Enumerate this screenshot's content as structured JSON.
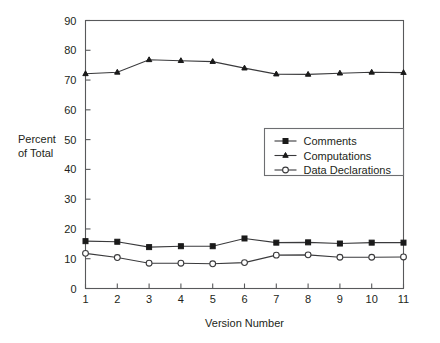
{
  "chart_data": {
    "type": "line",
    "title": "",
    "xlabel": "Version Number",
    "ylabel_line1": "Percent",
    "ylabel_line2": "of Total",
    "ylabel": "Percent of Total",
    "x": [
      1,
      2,
      3,
      4,
      5,
      6,
      7,
      8,
      9,
      10,
      11
    ],
    "xticklabels": [
      "1",
      "2",
      "3",
      "4",
      "5",
      "6",
      "7",
      "8",
      "9",
      "10",
      "11"
    ],
    "yticks": [
      0,
      10,
      20,
      30,
      40,
      50,
      60,
      70,
      80,
      90
    ],
    "yticklabels": [
      "0",
      "10",
      "20",
      "30",
      "40",
      "50",
      "60",
      "70",
      "80",
      "90"
    ],
    "xlim": [
      1,
      11
    ],
    "ylim": [
      0,
      90
    ],
    "grid": false,
    "legend_position": "center-right",
    "series": [
      {
        "name": "Comments",
        "marker": "filled-square",
        "color": "#1a1a1a",
        "values": [
          15.9,
          15.7,
          13.9,
          14.2,
          14.2,
          16.8,
          15.4,
          15.5,
          15.1,
          15.4,
          15.4
        ]
      },
      {
        "name": "Computations",
        "marker": "filled-triangle",
        "color": "#1a1a1a",
        "values": [
          72.1,
          72.6,
          76.8,
          76.5,
          76.2,
          74.0,
          72.0,
          71.9,
          72.3,
          72.6,
          72.5
        ]
      },
      {
        "name": "Data Declarations",
        "marker": "open-circle",
        "color": "#3a3a3c",
        "values": [
          11.8,
          10.4,
          8.5,
          8.5,
          8.3,
          8.7,
          11.2,
          11.3,
          10.5,
          10.5,
          10.6
        ]
      }
    ]
  },
  "legend": {
    "entries": [
      {
        "label": "Comments",
        "marker": "filled-square"
      },
      {
        "label": "Computations",
        "marker": "filled-triangle"
      },
      {
        "label": "Data Declarations",
        "marker": "open-circle"
      }
    ]
  },
  "colors": {
    "background": "#ffffff",
    "frame": "#58595b",
    "text": "#231f20",
    "series_dark": "#1a1a1a",
    "series_line": "#3a3a3c"
  }
}
